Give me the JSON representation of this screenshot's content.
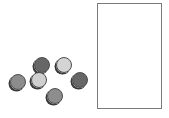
{
  "scene": {
    "description": "Six shaded discs of varying gray tones scattered to the left of an empty rectangular container",
    "container": {
      "x": 97,
      "y": 3,
      "width": 65,
      "height": 106,
      "border_color": "#7a7a7a",
      "fill": "#ffffff"
    },
    "discs": [
      {
        "id": "disc-left-gray",
        "cx": 18,
        "cy": 82,
        "r": 8,
        "fill": "#8c8c8c",
        "tone": "medium"
      },
      {
        "id": "disc-upper-dark",
        "cx": 42,
        "cy": 65,
        "r": 8,
        "fill": "#666666",
        "tone": "dark"
      },
      {
        "id": "disc-middle-light",
        "cx": 39,
        "cy": 80,
        "r": 8,
        "fill": "#cfcfcf",
        "tone": "light"
      },
      {
        "id": "disc-upper-light",
        "cx": 64,
        "cy": 65,
        "r": 8,
        "fill": "#d4d4d4",
        "tone": "light"
      },
      {
        "id": "disc-right-dark",
        "cx": 80,
        "cy": 80,
        "r": 8,
        "fill": "#676767",
        "tone": "dark"
      },
      {
        "id": "disc-bottom-gray",
        "cx": 55,
        "cy": 96,
        "r": 8,
        "fill": "#8d8d8d",
        "tone": "medium"
      }
    ]
  }
}
